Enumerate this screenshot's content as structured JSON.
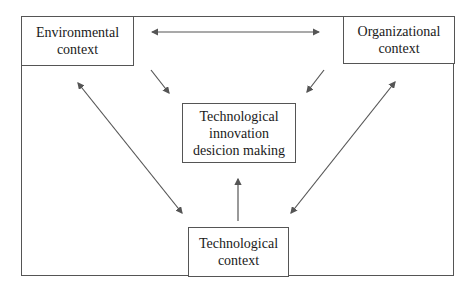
{
  "diagram": {
    "nodes": {
      "environmental": {
        "line1": "Environmental",
        "line2": "context"
      },
      "organizational": {
        "line1": "Organizational",
        "line2": "context"
      },
      "decision": {
        "line1": "Technological",
        "line2": "innovation",
        "line3": "desicion making"
      },
      "technological": {
        "line1": "Technological",
        "line2": "context"
      }
    },
    "edges": [
      {
        "from": "environmental",
        "to": "organizational",
        "type": "bidirectional"
      },
      {
        "from": "environmental",
        "to": "decision",
        "type": "directed"
      },
      {
        "from": "organizational",
        "to": "decision",
        "type": "directed"
      },
      {
        "from": "technological",
        "to": "decision",
        "type": "directed"
      },
      {
        "from": "environmental",
        "to": "technological",
        "type": "bidirectional"
      },
      {
        "from": "organizational",
        "to": "technological",
        "type": "bidirectional"
      }
    ],
    "colors": {
      "line": "#555555",
      "text": "#1a1a1a",
      "background": "#ffffff"
    }
  }
}
